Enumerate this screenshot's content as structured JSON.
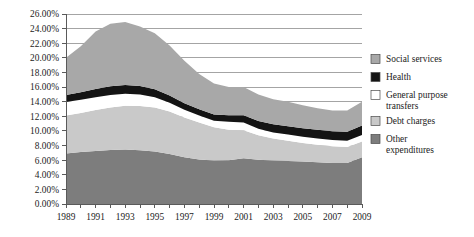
{
  "chart_data": {
    "type": "area",
    "stacked": true,
    "title": "",
    "subtitle": "",
    "xlabel": "",
    "ylabel": "",
    "grid": true,
    "legend_position": "right",
    "xlim": [
      1989,
      2009
    ],
    "ylim": [
      0,
      26
    ],
    "y_tick_format": "percent",
    "x": [
      1989,
      1990,
      1991,
      1992,
      1993,
      1994,
      1995,
      1996,
      1997,
      1998,
      1999,
      2000,
      2001,
      2002,
      2003,
      2004,
      2005,
      2006,
      2007,
      2008,
      2009
    ],
    "x_tick_labels": [
      "1989",
      "1991",
      "1993",
      "1995",
      "1997",
      "1999",
      "2001",
      "2003",
      "2005",
      "2007",
      "2009"
    ],
    "x_tick_values": [
      1989,
      1991,
      1993,
      1995,
      1997,
      1999,
      2001,
      2003,
      2005,
      2007,
      2009
    ],
    "y_tick_labels": [
      "0.00%",
      "2.00%",
      "4.00%",
      "6.00%",
      "8.00%",
      "10.00%",
      "12.00%",
      "14.00%",
      "16.00%",
      "18.00%",
      "20.00%",
      "22.00%",
      "24.00%",
      "26.00%"
    ],
    "y_tick_values": [
      0,
      2,
      4,
      6,
      8,
      10,
      12,
      14,
      16,
      18,
      20,
      22,
      24,
      26
    ],
    "stack_order_bottom_to_top": [
      "Other expenditures",
      "Debt charges",
      "General purpose transfers",
      "Health",
      "Social services"
    ],
    "series": [
      {
        "name": "Other expenditures",
        "color": "#7d7d7d",
        "values": [
          6.9,
          7.1,
          7.25,
          7.4,
          7.45,
          7.35,
          7.2,
          6.85,
          6.4,
          6.1,
          5.95,
          6.0,
          6.25,
          6.05,
          5.95,
          5.9,
          5.8,
          5.7,
          5.6,
          5.6,
          6.4
        ]
      },
      {
        "name": "Debt charges",
        "color": "#c9c9c9",
        "values": [
          5.2,
          5.35,
          5.6,
          5.8,
          6.0,
          6.05,
          6.0,
          5.8,
          5.45,
          5.05,
          4.55,
          4.15,
          3.85,
          3.35,
          3.0,
          2.75,
          2.55,
          2.4,
          2.3,
          2.2,
          2.15
        ]
      },
      {
        "name": "General purpose transfers",
        "color": "#ffffff",
        "values": [
          1.85,
          1.8,
          1.75,
          1.7,
          1.65,
          1.6,
          1.4,
          1.2,
          1.05,
          0.95,
          0.9,
          1.1,
          1.05,
          0.9,
          0.85,
          0.85,
          0.85,
          0.85,
          0.85,
          0.85,
          0.9
        ]
      },
      {
        "name": "Health",
        "color": "#141414",
        "values": [
          0.95,
          1.05,
          1.15,
          1.2,
          1.2,
          1.15,
          1.1,
          1.0,
          0.9,
          0.85,
          0.85,
          0.9,
          1.0,
          1.05,
          1.1,
          1.15,
          1.15,
          1.2,
          1.2,
          1.25,
          1.3
        ]
      },
      {
        "name": "Social services",
        "color": "#a8a8a8",
        "values": [
          5.1,
          6.3,
          7.85,
          8.55,
          8.6,
          8.15,
          7.65,
          6.85,
          5.8,
          4.85,
          4.25,
          3.85,
          3.85,
          3.65,
          3.45,
          3.35,
          3.15,
          2.95,
          2.85,
          2.9,
          3.25
        ]
      }
    ],
    "totals": [
      20.0,
      21.6,
      23.6,
      24.65,
      24.9,
      24.3,
      23.35,
      21.7,
      19.6,
      17.8,
      16.5,
      16.0,
      16.0,
      15.0,
      14.35,
      14.0,
      13.5,
      13.1,
      12.8,
      12.8,
      14.0
    ]
  },
  "legend": {
    "items": [
      {
        "label": "Social services",
        "color": "#a8a8a8",
        "swatch": "legend-swatch-social-services"
      },
      {
        "label": "Health",
        "color": "#141414",
        "swatch": "legend-swatch-health"
      },
      {
        "label": "General purpose transfers",
        "color": "#ffffff",
        "swatch": "legend-swatch-general-purpose-transfers"
      },
      {
        "label": "Debt charges",
        "color": "#c9c9c9",
        "swatch": "legend-swatch-debt-charges"
      },
      {
        "label": "Other expenditures",
        "color": "#7d7d7d",
        "swatch": "legend-swatch-other-expenditures"
      }
    ]
  },
  "colors": {
    "social_services": "#a8a8a8",
    "health": "#141414",
    "general_purpose_transfers": "#ffffff",
    "debt_charges": "#c9c9c9",
    "other_expenditures": "#7d7d7d",
    "gridline": "#8d8d8d",
    "axis": "#5a5a5a",
    "background": "#ffffff",
    "text": "#1c1c1c"
  }
}
